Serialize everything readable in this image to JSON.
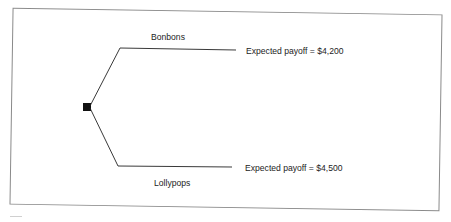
{
  "diagram": {
    "type": "decision-tree",
    "root": {
      "shape": "square",
      "meaning": "decision-node"
    },
    "branches": [
      {
        "label": "Bonbons",
        "outcome": "Expected payoff = $4,200",
        "payoff": 4200
      },
      {
        "label": "Lollypops",
        "outcome": "Expected payoff = $4,500",
        "payoff": 4500
      }
    ],
    "colors": {
      "line": "#222222",
      "node": "#111111",
      "frame": "#8a8a8a",
      "background": "#ffffff"
    }
  }
}
